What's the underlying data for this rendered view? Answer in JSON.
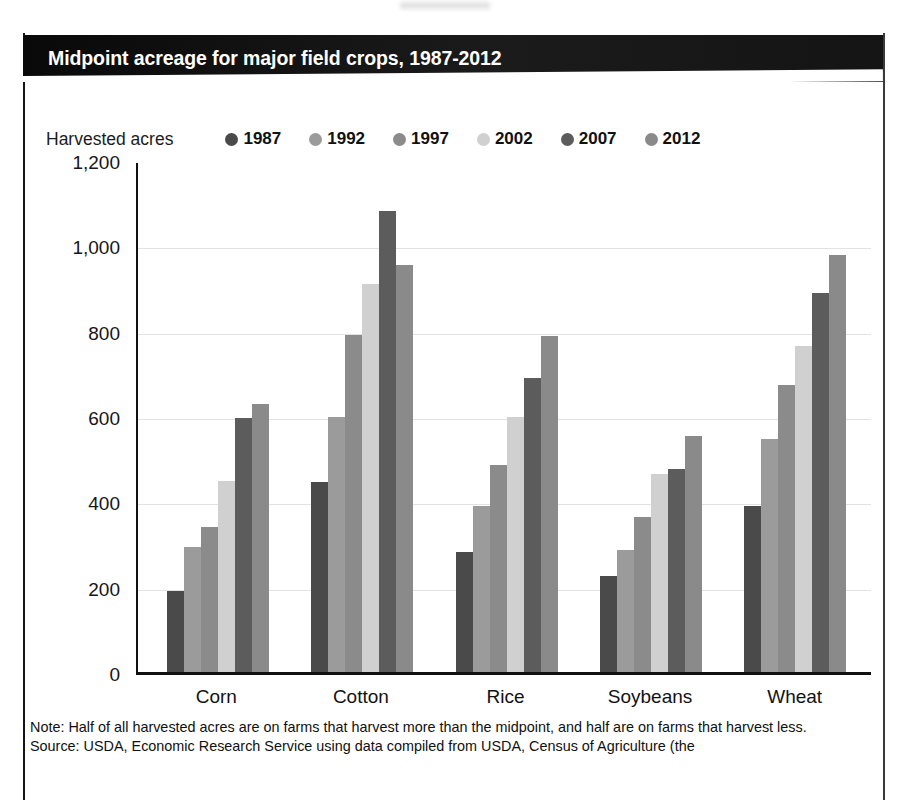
{
  "figure": {
    "title": "Midpoint acreage for major field crops, 1987-2012",
    "legend_title": "Harvested acres",
    "note": "Note: Half of all harvested acres are on farms that harvest more than the midpoint, and half are on farms that harvest less.",
    "source": "Source: USDA, Economic Research Service using data compiled from USDA, Census of Agriculture (the"
  },
  "colors": {
    "banner_background": "#141414",
    "banner_text": "#ffffff",
    "axis": "#111111",
    "gridline": "#e2e2e2",
    "series_1987": "#4a4a4a",
    "series_1992": "#9b9b9b",
    "series_1997": "#8b8b8b",
    "series_2002": "#d0d0d0",
    "series_2007": "#5c5c5c",
    "series_2012": "#8a8a8a"
  },
  "chart_data": {
    "type": "bar",
    "title": "Midpoint acreage for major field crops, 1987-2012",
    "xlabel": "",
    "ylabel": "Harvested acres",
    "ylim": [
      0,
      1200
    ],
    "yticks": [
      0,
      200,
      400,
      600,
      800,
      1000,
      1200
    ],
    "ytick_labels": [
      "0",
      "200",
      "400",
      "600",
      "800",
      "1,000",
      "1,200"
    ],
    "grid": true,
    "legend_position": "top",
    "categories": [
      "Corn",
      "Cotton",
      "Rice",
      "Soybeans",
      "Wheat"
    ],
    "series": [
      {
        "name": "1987",
        "color": "#4a4a4a",
        "values": [
          190,
          445,
          282,
          225,
          388
        ]
      },
      {
        "name": "1992",
        "color": "#9b9b9b",
        "values": [
          292,
          598,
          390,
          287,
          545
        ]
      },
      {
        "name": "1997",
        "color": "#8b8b8b",
        "values": [
          340,
          790,
          485,
          363,
          673
        ]
      },
      {
        "name": "2002",
        "color": "#d0d0d0",
        "values": [
          447,
          910,
          597,
          465,
          765
        ]
      },
      {
        "name": "2007",
        "color": "#5c5c5c",
        "values": [
          595,
          1080,
          688,
          475,
          888
        ]
      },
      {
        "name": "2012",
        "color": "#8a8a8a",
        "values": [
          627,
          955,
          787,
          553,
          978
        ]
      }
    ]
  }
}
